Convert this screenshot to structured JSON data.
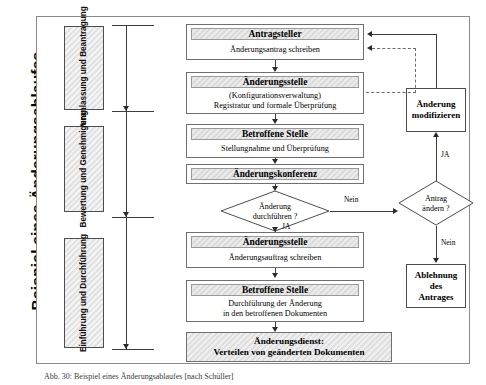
{
  "figure": {
    "vertical_title": "Beispiel eines Änderungsablaufes",
    "caption": "Abb. 30: Beispiel eines Änderungsablaufes [nach Schüller]"
  },
  "phases": [
    {
      "id": "phase-1",
      "lines": "Veranlassung und Beantragung"
    },
    {
      "id": "phase-2",
      "lines": "Bewertung und Genehmigung"
    },
    {
      "id": "phase-3",
      "lines": "Einführung und Durchführung"
    }
  ],
  "flow_boxes": [
    {
      "id": "antragsteller",
      "header": "Antragsteller",
      "body": [
        "Änderungsantrag schreiben"
      ]
    },
    {
      "id": "aenderungsstelle-1",
      "header": "Änderungsstelle",
      "body": [
        "(Konfigurationsverwaltung)",
        "Registratur und formale Überprüfung"
      ]
    },
    {
      "id": "betroffene-stelle-1",
      "header": "Betroffene Stelle",
      "body": [
        "Stellungnahme und Überprüfung"
      ]
    },
    {
      "id": "aenderungskonferenz",
      "header": "Änderungskonferenz",
      "body": []
    },
    {
      "id": "aenderungsstelle-2",
      "header": "Änderungsstelle",
      "body": [
        "Änderungsauftrag schreiben"
      ]
    },
    {
      "id": "betroffene-stelle-2",
      "header": "Betroffene Stelle",
      "body": [
        "Durchführung der Änderung",
        "in den betroffenen Dokumenten"
      ]
    }
  ],
  "hatched_box": {
    "id": "aenderungsdienst",
    "lines": [
      "Änderungsdienst:",
      "Verteilen von geänderten Dokumenten"
    ]
  },
  "side_boxes": [
    {
      "id": "aenderung-modifizieren",
      "lines": [
        "Änderung",
        "modifizieren"
      ]
    },
    {
      "id": "ablehnung-des-antrages",
      "lines": [
        "Ablehnung",
        "des",
        "Antrages"
      ]
    }
  ],
  "decisions": [
    {
      "id": "aenderung-durchfuehren",
      "lines": [
        "Änderung",
        "durchführen ?"
      ]
    },
    {
      "id": "antrag-aendern",
      "lines": [
        "Antrag",
        "ändern ?"
      ]
    }
  ],
  "edge_labels": {
    "durchfuehren_yes": "JA",
    "durchfuehren_no": "Nein",
    "aendern_yes": "JA",
    "aendern_no": "Nein"
  },
  "colors": {
    "frame": "#8a8a8a",
    "box_border": "#6f6f6f",
    "header_fill": "#dcdcdc",
    "hatch_fill": "#e0e0e0",
    "line": "#3d3d3d",
    "text": "#000000"
  }
}
